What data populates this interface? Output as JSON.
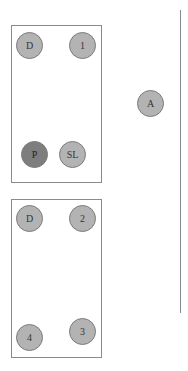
{
  "groups": [
    {
      "name": "table-1",
      "nodes": [
        {
          "label": "D",
          "shade": "light"
        },
        {
          "label": "1",
          "shade": "light"
        },
        {
          "label": "P",
          "shade": "dark"
        },
        {
          "label": "SL",
          "shade": "light"
        }
      ]
    },
    {
      "name": "table-2",
      "nodes": [
        {
          "label": "D",
          "shade": "light"
        },
        {
          "label": "2",
          "shade": "light"
        },
        {
          "label": "4",
          "shade": "light"
        },
        {
          "label": "3",
          "shade": "light"
        }
      ]
    }
  ],
  "standalone": {
    "label": "A",
    "shade": "light"
  },
  "colors": {
    "light": "#b3b3b3",
    "dark": "#7e7e7e",
    "border": "#8a8a8a"
  }
}
